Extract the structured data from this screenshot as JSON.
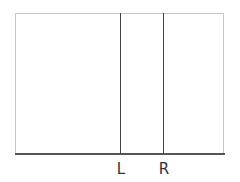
{
  "diagram": {
    "frame": {
      "left": 15,
      "top": 13,
      "right": 224,
      "bottom": 154
    },
    "markers": [
      {
        "id": "L",
        "label": "L",
        "x": 120
      },
      {
        "id": "R",
        "label": "R",
        "x": 163
      }
    ],
    "colors": {
      "frame": "#c8c8c8",
      "axis": "#555555",
      "marker_line": "#444444",
      "label": "#333333"
    }
  }
}
